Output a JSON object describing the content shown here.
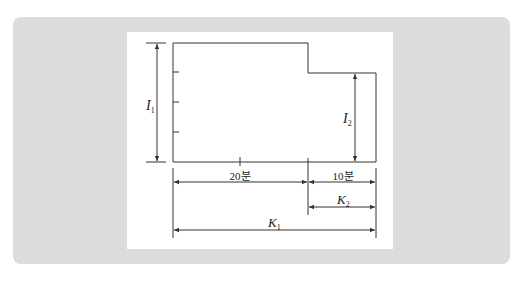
{
  "diagram": {
    "labels": {
      "I1": "I",
      "I1_sub": "1",
      "I2": "I",
      "I2_sub": "2",
      "K1": "K",
      "K1_sub": "1",
      "K2": "K",
      "K2_sub": "2",
      "seg_left": "20분",
      "seg_right": "10분"
    },
    "colors": {
      "panel_bg": "#dcdcdc",
      "card_bg": "#ffffff",
      "line": "#333333"
    }
  }
}
